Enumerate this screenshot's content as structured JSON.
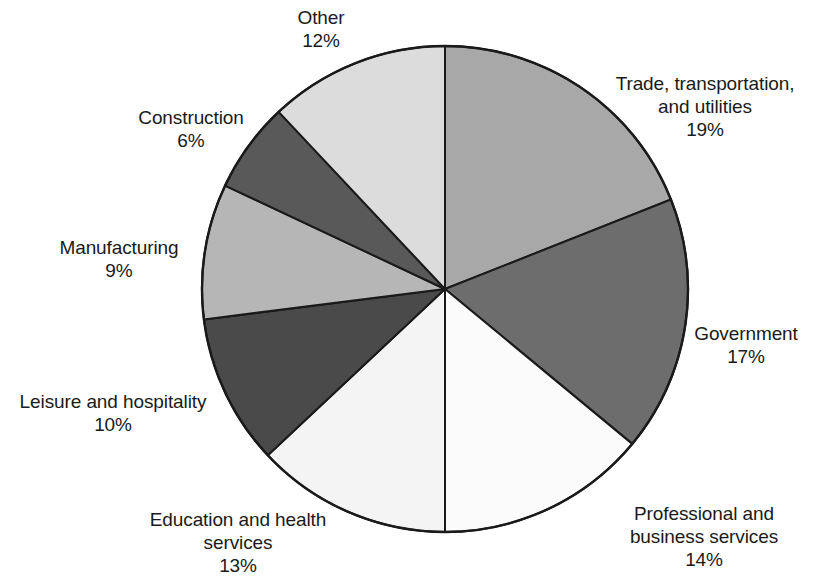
{
  "chart_data": {
    "type": "pie",
    "title": "",
    "subtitle": "",
    "xlabel": "",
    "ylabel": "",
    "legend_position": "none",
    "grid": false,
    "units": "percent",
    "start_angle_deg": 0,
    "direction": "clockwise",
    "categories": [
      "Trade, transportation, and utilities",
      "Government",
      "Professional and business services",
      "Education and health services",
      "Leisure and hospitality",
      "Manufacturing",
      "Construction",
      "Other"
    ],
    "values": [
      19,
      17,
      14,
      13,
      10,
      9,
      6,
      12
    ],
    "slices": [
      {
        "id": "trade",
        "label": "Trade, transportation,\nand utilities",
        "label_full": "Trade, transportation, and utilities",
        "value": 19,
        "value_label": "19%",
        "color": "#a8a8a8"
      },
      {
        "id": "government",
        "label": "Government",
        "label_full": "Government",
        "value": 17,
        "value_label": "17%",
        "color": "#6d6d6d"
      },
      {
        "id": "professional",
        "label": "Professional and\nbusiness services",
        "label_full": "Professional and business services",
        "value": 14,
        "value_label": "14%",
        "color": "#fbfbfb"
      },
      {
        "id": "education",
        "label": "Education and health\nservices",
        "label_full": "Education and health services",
        "value": 13,
        "value_label": "13%",
        "color": "#f4f4f4"
      },
      {
        "id": "leisure",
        "label": "Leisure and hospitality",
        "label_full": "Leisure and hospitality",
        "value": 10,
        "value_label": "10%",
        "color": "#4a4a4a"
      },
      {
        "id": "manufacturing",
        "label": "Manufacturing",
        "label_full": "Manufacturing",
        "value": 9,
        "value_label": "9%",
        "color": "#b6b6b6"
      },
      {
        "id": "construction",
        "label": "Construction",
        "label_full": "Construction",
        "value": 6,
        "value_label": "6%",
        "color": "#595959"
      },
      {
        "id": "other",
        "label": "Other",
        "label_full": "Other",
        "value": 12,
        "value_label": "12%",
        "color": "#dcdcdc"
      }
    ]
  },
  "labels": {
    "other": "Other\n12%",
    "trade": "Trade, transportation,\nand utilities\n19%",
    "government": "Government\n17%",
    "professional": "Professional and\nbusiness services\n14%",
    "education": "Education and health\nservices\n13%",
    "leisure": "Leisure and hospitality\n10%",
    "manufacturing": "Manufacturing\n9%",
    "construction": "Construction\n6%"
  },
  "geometry": {
    "center_x": 445,
    "center_y": 289,
    "radius": 243,
    "outline_color": "#1a1a1a"
  }
}
